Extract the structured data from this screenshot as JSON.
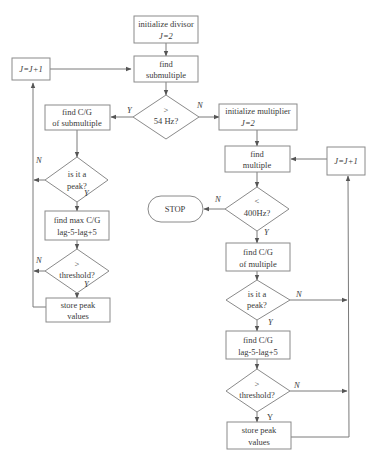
{
  "diagram": {
    "type": "flowchart",
    "colors": {
      "stroke": "#7a7a7a",
      "text": "#3a3a3a",
      "background": "#ffffff"
    },
    "nodes": {
      "init_divisor": {
        "line1": "initialize divisor",
        "line2": "J=2"
      },
      "find_submultiple": {
        "line1": "find",
        "line2": "submultiple"
      },
      "dec_54hz": {
        "line1": ">",
        "line2": "54 Hz?"
      },
      "left_j_inc": {
        "line1": "J=J+1"
      },
      "find_cg_sub": {
        "line1": "find C/G",
        "line2": "of submultiple"
      },
      "peak_left": {
        "line1": "is it a",
        "line2": "peak?"
      },
      "find_max_cg": {
        "line1": "find max C/G",
        "line2": "lag-5-lag+5"
      },
      "thresh_left": {
        "line1": ">",
        "line2": "threshold?"
      },
      "store_left": {
        "line1": "store peak",
        "line2": "values"
      },
      "init_multiplier": {
        "line1": "initialize multiplier",
        "line2": "J=2"
      },
      "find_multiple": {
        "line1": "find",
        "line2": "multiple"
      },
      "right_j_inc": {
        "line1": "J=J+1"
      },
      "dec_400hz": {
        "line1": "<",
        "line2": "400Hz?"
      },
      "stop": {
        "line1": "STOP"
      },
      "find_cg_mult": {
        "line1": "find C/G",
        "line2": "of multiple"
      },
      "peak_right": {
        "line1": "is it a",
        "line2": "peak?"
      },
      "find_cg_lag": {
        "line1": "find C/G",
        "line2": "lag-5-lag+5"
      },
      "thresh_right": {
        "line1": ">",
        "line2": "threshold?"
      },
      "store_right": {
        "line1": "store peak",
        "line2": "values"
      }
    },
    "edge_labels": {
      "y_54": "Y",
      "n_54": "N",
      "n_peak_left": "N",
      "y_peak_left": "Y",
      "n_thresh_left": "N",
      "y_thresh_left": "Y",
      "n_400": "N",
      "y_400": "Y",
      "n_peak_right": "N",
      "y_peak_right": "Y",
      "n_thresh_right": "N",
      "y_thresh_right": "Y"
    }
  }
}
